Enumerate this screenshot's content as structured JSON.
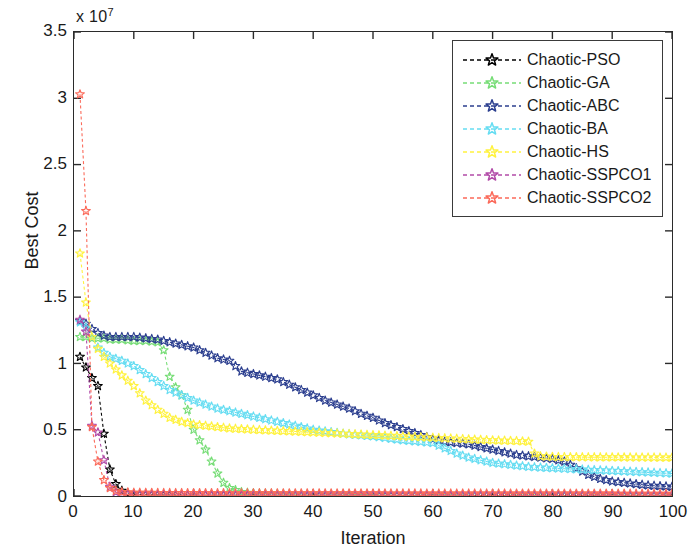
{
  "chart_data": {
    "type": "line",
    "title": "",
    "xlabel": "Iteration",
    "ylabel": "Best Cost",
    "y_exponent_label": "x 10",
    "y_exponent_power": "7",
    "xlim": [
      0,
      100
    ],
    "ylim": [
      0,
      35000000
    ],
    "xticks": [
      0,
      10,
      20,
      30,
      40,
      50,
      60,
      70,
      80,
      90,
      100
    ],
    "yticks": [
      0,
      5000000,
      10000000,
      15000000,
      20000000,
      25000000,
      30000000,
      35000000
    ],
    "ytick_labels": [
      "0",
      "0.5",
      "1",
      "1.5",
      "2",
      "2.5",
      "3",
      "3.5"
    ],
    "xtick_labels": [
      "0",
      "10",
      "20",
      "30",
      "40",
      "50",
      "60",
      "70",
      "80",
      "90",
      "100"
    ],
    "grid": false,
    "legend_position": "upper right",
    "marker": "star",
    "linestyle": "dashed",
    "series": [
      {
        "name": "Chaotic-PSO",
        "color": "#000000",
        "x": [
          1,
          2,
          3,
          4,
          5,
          6,
          7,
          8,
          9,
          10,
          12,
          14,
          16,
          18,
          20,
          25,
          30,
          35,
          40,
          45,
          50,
          55,
          60,
          65,
          70,
          75,
          80,
          85,
          90,
          95,
          100
        ],
        "values": [
          10500000,
          9700000,
          8900000,
          8300000,
          4700000,
          2000000,
          900000,
          400000,
          200000,
          120000,
          90000,
          80000,
          70000,
          65000,
          60000,
          55000,
          50000,
          48000,
          45000,
          43000,
          40000,
          38000,
          36000,
          34000,
          32000,
          30000,
          28000,
          26000,
          24000,
          22000,
          20000
        ]
      },
      {
        "name": "Chaotic-GA",
        "color": "#77dd77",
        "x": [
          1,
          2,
          3,
          4,
          5,
          6,
          8,
          10,
          12,
          14,
          15,
          16,
          17,
          18,
          19,
          20,
          21,
          22,
          23,
          24,
          25,
          26,
          28,
          30,
          35,
          40,
          50,
          60,
          70,
          80,
          90,
          100
        ],
        "values": [
          12000000,
          12000000,
          11900000,
          11900000,
          11900000,
          11800000,
          11800000,
          11700000,
          11700000,
          11600000,
          11000000,
          9000000,
          8200000,
          7600000,
          6500000,
          5000000,
          4200000,
          3500000,
          2600000,
          1700000,
          1000000,
          600000,
          300000,
          200000,
          150000,
          120000,
          100000,
          90000,
          80000,
          70000,
          60000,
          50000
        ]
      },
      {
        "name": "Chaotic-ABC",
        "color": "#2c3f8f",
        "x": [
          1,
          2,
          3,
          4,
          5,
          6,
          8,
          10,
          12,
          14,
          16,
          18,
          20,
          22,
          24,
          26,
          28,
          30,
          32,
          34,
          36,
          38,
          40,
          42,
          44,
          46,
          48,
          50,
          52,
          54,
          56,
          58,
          60,
          62,
          64,
          66,
          68,
          70,
          72,
          74,
          76,
          78,
          80,
          82,
          84,
          86,
          88,
          90,
          92,
          94,
          96,
          98,
          100
        ],
        "values": [
          13200000,
          13000000,
          12600000,
          12300000,
          12100000,
          12000000,
          12000000,
          12000000,
          11900000,
          11800000,
          11600000,
          11400000,
          11200000,
          10800000,
          10400000,
          10200000,
          9400000,
          9200000,
          9000000,
          8800000,
          8400000,
          8000000,
          7600000,
          7200000,
          6900000,
          6600000,
          6200000,
          5900000,
          5500000,
          5200000,
          4900000,
          4600000,
          4300000,
          4100000,
          4000000,
          3900000,
          3700000,
          3500000,
          3300000,
          3100000,
          3000000,
          2900000,
          2800000,
          2600000,
          2100000,
          1600000,
          1300000,
          1100000,
          1000000,
          900000,
          800000,
          750000,
          700000
        ]
      },
      {
        "name": "Chaotic-BA",
        "color": "#66ddf2",
        "x": [
          1,
          2,
          3,
          4,
          5,
          6,
          8,
          10,
          12,
          14,
          16,
          18,
          20,
          22,
          24,
          26,
          28,
          30,
          32,
          34,
          36,
          38,
          40,
          45,
          50,
          55,
          60,
          62,
          64,
          66,
          68,
          70,
          72,
          74,
          76,
          80,
          85,
          90,
          95,
          100
        ],
        "values": [
          13100000,
          12700000,
          12000000,
          11200000,
          10800000,
          10500000,
          10200000,
          9800000,
          9200000,
          8600000,
          8000000,
          7600000,
          7200000,
          6900000,
          6600000,
          6400000,
          6200000,
          6000000,
          5800000,
          5600000,
          5400000,
          5200000,
          5000000,
          4700000,
          4500000,
          4200000,
          4000000,
          3600000,
          3200000,
          2900000,
          2700000,
          2500000,
          2400000,
          2300000,
          2200000,
          2100000,
          2000000,
          1900000,
          1800000,
          1700000
        ]
      },
      {
        "name": "Chaotic-HS",
        "color": "#fff23f",
        "x": [
          1,
          2,
          3,
          4,
          5,
          6,
          8,
          10,
          12,
          14,
          16,
          18,
          20,
          22,
          24,
          26,
          28,
          30,
          35,
          40,
          45,
          50,
          55,
          60,
          65,
          70,
          74,
          76,
          77,
          78,
          80,
          85,
          90,
          95,
          100
        ],
        "values": [
          18300000,
          14600000,
          12000000,
          11100000,
          10500000,
          10000000,
          9100000,
          8300000,
          7200000,
          6500000,
          5900000,
          5600000,
          5400000,
          5300000,
          5200000,
          5100000,
          5050000,
          5000000,
          4900000,
          4800000,
          4700000,
          4600000,
          4500000,
          4400000,
          4300000,
          4200000,
          4150000,
          4100000,
          3200000,
          3000000,
          2950000,
          2930000,
          2920000,
          2910000,
          2900000
        ]
      },
      {
        "name": "Chaotic-SSPCO1",
        "color": "#b24ba8",
        "x": [
          1,
          2,
          3,
          4,
          5,
          6,
          7,
          8,
          10,
          15,
          20,
          30,
          40,
          50,
          60,
          70,
          80,
          90,
          100
        ],
        "values": [
          13300000,
          12400000,
          5300000,
          4800000,
          2700000,
          700000,
          300000,
          150000,
          100000,
          80000,
          70000,
          60000,
          55000,
          50000,
          45000,
          42000,
          40000,
          38000,
          36000
        ]
      },
      {
        "name": "Chaotic-SSPCO2",
        "color": "#fb6a5a",
        "x": [
          1,
          2,
          3,
          4,
          5,
          6,
          7,
          8,
          10,
          15,
          20,
          30,
          40,
          50,
          60,
          70,
          80,
          90,
          100
        ],
        "values": [
          30300000,
          21500000,
          5200000,
          2600000,
          1200000,
          600000,
          400000,
          300000,
          250000,
          230000,
          220000,
          210000,
          205000,
          200000,
          195000,
          190000,
          185000,
          180000,
          175000
        ]
      }
    ]
  },
  "legend": {
    "entries": [
      {
        "label": "Chaotic-PSO",
        "color": "#000000"
      },
      {
        "label": "Chaotic-GA",
        "color": "#77dd77"
      },
      {
        "label": "Chaotic-ABC",
        "color": "#2c3f8f"
      },
      {
        "label": "Chaotic-BA",
        "color": "#66ddf2"
      },
      {
        "label": "Chaotic-HS",
        "color": "#fff23f"
      },
      {
        "label": "Chaotic-SSPCO1",
        "color": "#b24ba8"
      },
      {
        "label": "Chaotic-SSPCO2",
        "color": "#fb6a5a"
      }
    ]
  }
}
